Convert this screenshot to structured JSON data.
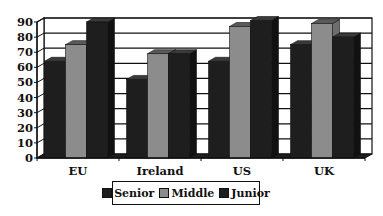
{
  "chart_data": {
    "type": "bar",
    "style": "3d-clustered-column",
    "title": "",
    "xlabel": "",
    "ylabel": "",
    "categories": [
      "EU",
      "Ireland",
      "US",
      "UK"
    ],
    "series": [
      {
        "name": "Senior",
        "color": "#1e1e1e",
        "values": [
          64,
          52,
          64,
          75
        ]
      },
      {
        "name": "Middle",
        "color": "#8c8c8c",
        "values": [
          75,
          69,
          87,
          89
        ]
      },
      {
        "name": "Junior",
        "color": "#1e1e1e",
        "values": [
          90,
          69,
          91,
          80
        ]
      }
    ],
    "ylim": [
      0,
      90
    ],
    "yticks": [
      0,
      10,
      20,
      30,
      40,
      50,
      60,
      70,
      80,
      90
    ],
    "grid": true,
    "legend_position": "bottom"
  },
  "legend": {
    "items": [
      {
        "label": "Senior",
        "color": "#1e1e1e"
      },
      {
        "label": "Middle",
        "color": "#8c8c8c"
      },
      {
        "label": "Junior",
        "color": "#1e1e1e"
      }
    ]
  }
}
